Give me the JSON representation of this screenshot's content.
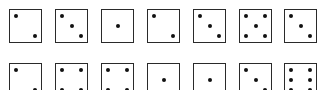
{
  "colors": {
    "border": "#2a2a2a",
    "pip": "#111111",
    "background": "#ffffff"
  },
  "rows": [
    {
      "top": 9,
      "dice": [
        {
          "left": 9,
          "value": 2,
          "pips": [
            [
              0.2,
              0.2
            ],
            [
              0.8,
              0.8
            ]
          ]
        },
        {
          "left": 55,
          "value": 3,
          "pips": [
            [
              0.2,
              0.2
            ],
            [
              0.5,
              0.5
            ],
            [
              0.8,
              0.8
            ]
          ]
        },
        {
          "left": 101,
          "value": 1,
          "pips": [
            [
              0.5,
              0.5
            ]
          ]
        },
        {
          "left": 147,
          "value": 2,
          "pips": [
            [
              0.2,
              0.2
            ],
            [
              0.8,
              0.8
            ]
          ]
        },
        {
          "left": 193,
          "value": 3,
          "pips": [
            [
              0.2,
              0.2
            ],
            [
              0.5,
              0.5
            ],
            [
              0.8,
              0.8
            ]
          ]
        },
        {
          "left": 239,
          "value": 5,
          "pips": [
            [
              0.2,
              0.2
            ],
            [
              0.8,
              0.2
            ],
            [
              0.5,
              0.5
            ],
            [
              0.2,
              0.8
            ],
            [
              0.8,
              0.8
            ]
          ]
        },
        {
          "left": 284,
          "value": 3,
          "pips": [
            [
              0.2,
              0.2
            ],
            [
              0.5,
              0.5
            ],
            [
              0.8,
              0.8
            ]
          ]
        }
      ]
    },
    {
      "top": 63,
      "dice": [
        {
          "left": 9,
          "value": 2,
          "pips": [
            [
              0.2,
              0.2
            ],
            [
              0.8,
              0.8
            ]
          ]
        },
        {
          "left": 55,
          "value": 4,
          "pips": [
            [
              0.2,
              0.2
            ],
            [
              0.8,
              0.2
            ],
            [
              0.2,
              0.8
            ],
            [
              0.8,
              0.8
            ]
          ]
        },
        {
          "left": 101,
          "value": 4,
          "pips": [
            [
              0.2,
              0.2
            ],
            [
              0.8,
              0.2
            ],
            [
              0.2,
              0.8
            ],
            [
              0.8,
              0.8
            ]
          ]
        },
        {
          "left": 147,
          "value": 1,
          "pips": [
            [
              0.5,
              0.5
            ]
          ]
        },
        {
          "left": 193,
          "value": 1,
          "pips": [
            [
              0.5,
              0.5
            ]
          ]
        },
        {
          "left": 239,
          "value": 3,
          "pips": [
            [
              0.2,
              0.2
            ],
            [
              0.5,
              0.5
            ],
            [
              0.8,
              0.8
            ]
          ]
        },
        {
          "left": 284,
          "value": 6,
          "pips": [
            [
              0.2,
              0.2
            ],
            [
              0.8,
              0.2
            ],
            [
              0.2,
              0.5
            ],
            [
              0.8,
              0.5
            ],
            [
              0.2,
              0.8
            ],
            [
              0.8,
              0.8
            ]
          ]
        }
      ]
    }
  ]
}
